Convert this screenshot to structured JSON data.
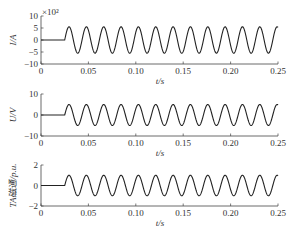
{
  "figure": {
    "caption": "",
    "x_axis": {
      "label": "t/s",
      "range": [
        0,
        0.25
      ],
      "ticks": [
        "0",
        "0.05",
        "0.10",
        "0.15",
        "0.20",
        "0.25"
      ]
    }
  },
  "chart_data": [
    {
      "type": "line",
      "title": "",
      "xlabel": "t/s",
      "ylabel": "I/A",
      "y_multiplier": "×10²",
      "xlim": [
        0,
        0.25
      ],
      "ylim": [
        -10,
        10
      ],
      "x_ticks": [
        0,
        0.05,
        0.1,
        0.15,
        0.2,
        0.25
      ],
      "y_ticks": [
        -10,
        -5,
        0,
        5,
        10
      ],
      "y_tick_labels": [
        "−10",
        "−5",
        "0",
        "5",
        "10"
      ],
      "grid": false,
      "series": [
        {
          "name": "current",
          "description": "zero until ~0.025 s, then sinusoid amplitude ~5.5 (×10² A), ~12 cycles to 0.25 s",
          "onset": 0.025,
          "amplitude": 5.5,
          "offset": 0,
          "cycles": 12.3
        }
      ]
    },
    {
      "type": "line",
      "title": "",
      "xlabel": "t/s",
      "ylabel": "U/V",
      "xlim": [
        0,
        0.25
      ],
      "ylim": [
        -10,
        10
      ],
      "x_ticks": [
        0,
        0.05,
        0.1,
        0.15,
        0.2,
        0.25
      ],
      "y_ticks": [
        -10,
        0,
        10
      ],
      "y_tick_labels": [
        "−10",
        "0",
        "10"
      ],
      "grid": false,
      "series": [
        {
          "name": "voltage",
          "description": "zero until ~0.025 s, then sinusoid amplitude ~5 V",
          "onset": 0.025,
          "amplitude": 5,
          "offset": 0,
          "cycles": 12.3
        }
      ]
    },
    {
      "type": "line",
      "title": "",
      "xlabel": "t/s",
      "ylabel": "TA磁通/p.u.",
      "xlim": [
        0,
        0.25
      ],
      "ylim": [
        -2,
        2
      ],
      "x_ticks": [
        0,
        0.05,
        0.1,
        0.15,
        0.2,
        0.25
      ],
      "y_ticks": [
        -2,
        0,
        2
      ],
      "y_tick_labels": [
        "−2",
        "0",
        "2"
      ],
      "grid": false,
      "series": [
        {
          "name": "TA flux",
          "description": "zero until ~0.025 s, then sinusoid amplitude ~1 p.u.",
          "onset": 0.025,
          "amplitude": 1.0,
          "offset": 0,
          "cycles": 12.3
        }
      ]
    }
  ]
}
